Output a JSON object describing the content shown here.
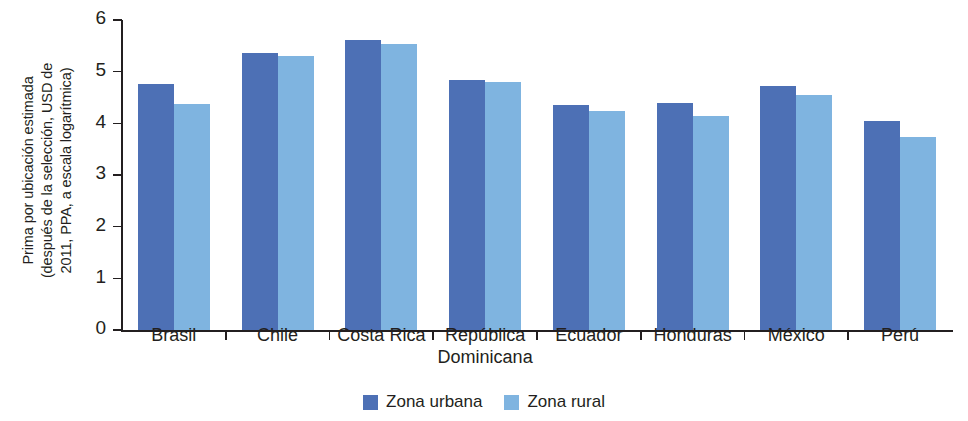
{
  "chart_data": {
    "type": "bar",
    "title": "",
    "subtitle": "",
    "xlabel": "",
    "ylabel": "Prima por ubicación estimada (después de la selección, USD de 2011, PPA, a escala logarítmica)",
    "ylabel_lines": [
      "Prima por ubicación estimada",
      "(después de la selección, USD de",
      "2011, PPA, a escala logarítmica)"
    ],
    "ylim": [
      0,
      6
    ],
    "yticks": [
      0,
      1,
      2,
      3,
      4,
      5,
      6
    ],
    "ytick_labels": [
      "0",
      "1",
      "2",
      "3",
      "4",
      "5",
      "6"
    ],
    "grid": false,
    "legend_position": "bottom-center",
    "categories": [
      "Brasil",
      "Chile",
      "Costa Rica",
      "República Dominicana",
      "Ecuador",
      "Honduras",
      "México",
      "Perú"
    ],
    "category_label_lines": [
      [
        "Brasil"
      ],
      [
        "Chile"
      ],
      [
        "Costa Rica"
      ],
      [
        "República",
        "Dominicana"
      ],
      [
        "Ecuador"
      ],
      [
        "Honduras"
      ],
      [
        "México"
      ],
      [
        "Perú"
      ]
    ],
    "series": [
      {
        "name": "Zona urbana",
        "color": "#4d70b5",
        "values": [
          4.77,
          5.37,
          5.62,
          4.84,
          4.36,
          4.4,
          4.73,
          4.05
        ]
      },
      {
        "name": "Zona rural",
        "color": "#7fb4e0",
        "values": [
          4.37,
          5.3,
          5.53,
          4.8,
          4.24,
          4.14,
          4.55,
          3.73
        ]
      }
    ]
  },
  "legend": {
    "items": [
      {
        "label": "Zona urbana",
        "color": "#4d70b5"
      },
      {
        "label": "Zona rural",
        "color": "#7fb4e0"
      }
    ]
  },
  "colors": {
    "urban": "#4d70b5",
    "rural": "#7fb4e0",
    "axis": "#231f20",
    "text": "#231f20",
    "background": "#ffffff"
  }
}
